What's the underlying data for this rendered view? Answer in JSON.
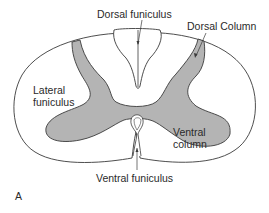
{
  "figure": {
    "panel_label": "A",
    "colors": {
      "outline": "#3a3a3a",
      "gray_matter": "#b4b4b4",
      "background": "#ffffff",
      "text": "#2a2a2a"
    },
    "labels": {
      "dorsal_funiculus": "Dorsal funiculus",
      "dorsal_column": "Dorsal Column",
      "lateral_funiculus_line1": "Lateral",
      "lateral_funiculus_line2": "funiculus",
      "ventral_column_line1": "Ventral",
      "ventral_column_line2": "column",
      "ventral_funiculus": "Ventral funiculus"
    }
  }
}
